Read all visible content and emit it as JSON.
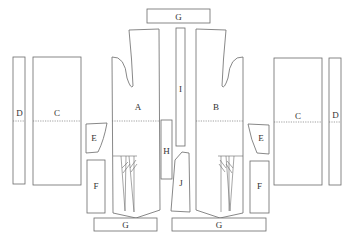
{
  "diagram": {
    "type": "garment-pattern-layout",
    "background": "#ffffff",
    "line_color": "#6a6a6a",
    "pieces": [
      {
        "id": "G-top",
        "label": "G"
      },
      {
        "id": "A",
        "label": "A"
      },
      {
        "id": "B",
        "label": "B"
      },
      {
        "id": "I",
        "label": "I"
      },
      {
        "id": "H",
        "label": "H"
      },
      {
        "id": "J",
        "label": "J"
      },
      {
        "id": "C-left",
        "label": "C"
      },
      {
        "id": "D-left",
        "label": "D"
      },
      {
        "id": "E-left",
        "label": "E"
      },
      {
        "id": "F-left",
        "label": "F"
      },
      {
        "id": "C-right",
        "label": "C"
      },
      {
        "id": "D-right",
        "label": "D"
      },
      {
        "id": "E-right",
        "label": "E"
      },
      {
        "id": "F-right",
        "label": "F"
      },
      {
        "id": "G-bottom-left",
        "label": "G"
      },
      {
        "id": "G-bottom-right",
        "label": "G"
      }
    ],
    "fold_line": "dotted horizontal line at waist level"
  }
}
